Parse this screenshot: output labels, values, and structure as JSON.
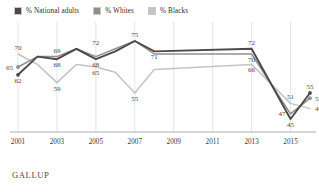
{
  "footer": {
    "brand": "GALLUP"
  },
  "legend": {
    "items": [
      {
        "label": "% National adults",
        "color": "#4a4a4a",
        "key": "national"
      },
      {
        "label": "% Whites",
        "color": "#8e8e8e",
        "key": "whites"
      },
      {
        "label": "% Blacks",
        "color": "#c4c4c4",
        "key": "blacks"
      }
    ]
  },
  "chart_data": {
    "type": "line",
    "title": "",
    "xlabel": "",
    "ylabel": "",
    "grid": "vertical",
    "legend_position": "top-left",
    "xlim": [
      2001,
      2016
    ],
    "ylim": [
      40,
      80
    ],
    "x_ticks": [
      "2001",
      "2003",
      "2005",
      "2007",
      "2009",
      "2011",
      "2013",
      "2015"
    ],
    "x_tick_values": [
      2001,
      2003,
      2005,
      2007,
      2009,
      2011,
      2013,
      2015
    ],
    "x": [
      2001,
      2002,
      2003,
      2004,
      2005,
      2006,
      2007,
      2008,
      2013,
      2015,
      2016
    ],
    "series": [
      {
        "name": "% National adults",
        "color": "#4a4a4a",
        "values": [
          62,
          69,
          68,
          72,
          68,
          71,
          75,
          71,
          72,
          45,
          55
        ],
        "labels": [
          {
            "x": 2001,
            "y": 62,
            "text": "62",
            "anchor": "below"
          },
          {
            "x": 2003,
            "y": 68,
            "text": "68",
            "anchor": "below"
          },
          {
            "x": 2005,
            "y": 68,
            "text": "68",
            "anchor": "below"
          },
          {
            "x": 2007,
            "y": 75,
            "text": "75",
            "anchor": "above"
          },
          {
            "x": 2008,
            "y": 71,
            "text": "71",
            "anchor": "below"
          },
          {
            "x": 2013,
            "y": 72,
            "text": "72",
            "anchor": "above"
          },
          {
            "x": 2015,
            "y": 45,
            "text": "45",
            "anchor": "below"
          },
          {
            "x": 2016,
            "y": 55,
            "text": "55",
            "anchor": "above"
          }
        ]
      },
      {
        "name": "% Whites",
        "color": "#8e8e8e",
        "values": [
          65,
          69,
          69,
          72,
          69,
          72,
          75,
          70,
          70,
          47,
          53
        ],
        "labels": [
          {
            "x": 2001,
            "y": 65,
            "text": "65",
            "anchor": "left"
          },
          {
            "x": 2003,
            "y": 69,
            "text": "69",
            "anchor": "above"
          },
          {
            "x": 2005,
            "y": 72,
            "text": "72",
            "anchor": "above"
          },
          {
            "x": 2013,
            "y": 70,
            "text": "70",
            "anchor": "below"
          },
          {
            "x": 2015,
            "y": 47,
            "text": "47",
            "anchor": "left"
          },
          {
            "x": 2016,
            "y": 53,
            "text": "53",
            "anchor": "right"
          }
        ]
      },
      {
        "name": "% Blacks",
        "color": "#c4c4c4",
        "values": [
          70,
          66,
          59,
          66,
          65,
          63,
          55,
          64,
          66,
          51,
          49
        ],
        "labels": [
          {
            "x": 2001,
            "y": 70,
            "text": "70",
            "anchor": "above"
          },
          {
            "x": 2003,
            "y": 59,
            "text": "59",
            "anchor": "below"
          },
          {
            "x": 2005,
            "y": 65,
            "text": "65",
            "anchor": "below"
          },
          {
            "x": 2007,
            "y": 55,
            "text": "55",
            "anchor": "below"
          },
          {
            "x": 2013,
            "y": 66,
            "text": "66",
            "anchor": "below"
          },
          {
            "x": 2015,
            "y": 51,
            "text": "51",
            "anchor": "above"
          },
          {
            "x": 2016,
            "y": 49,
            "text": "49",
            "anchor": "right"
          }
        ]
      }
    ]
  }
}
